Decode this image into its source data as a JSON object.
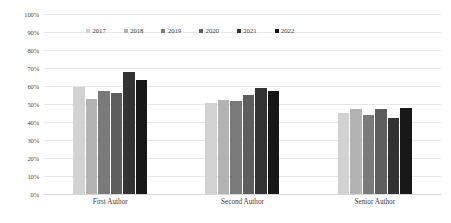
{
  "chart_data": {
    "type": "bar",
    "title": "",
    "subtitle": "",
    "xlabel": "",
    "ylabel": "",
    "categories": [
      "First Author",
      "Second Author",
      "Senior Author"
    ],
    "series": [
      {
        "name": "2017",
        "color": "#d2d2d2",
        "values": [
          59.5,
          50.5,
          45.0
        ]
      },
      {
        "name": "2018",
        "color": "#b3b3b3",
        "values": [
          53.0,
          52.0,
          47.5
        ]
      },
      {
        "name": "2019",
        "color": "#7a7a7a",
        "values": [
          57.5,
          51.5,
          44.0
        ]
      },
      {
        "name": "2020",
        "color": "#5e5e5e",
        "values": [
          56.0,
          55.0,
          47.5
        ]
      },
      {
        "name": "2021",
        "color": "#333333",
        "values": [
          68.0,
          59.0,
          42.5
        ]
      },
      {
        "name": "2022",
        "color": "#171717",
        "values": [
          63.5,
          57.5,
          48.0
        ]
      }
    ],
    "ylim": [
      0,
      100
    ],
    "ytick_labels": [
      "100%",
      "90%",
      "80%",
      "70%",
      "60%",
      "50%",
      "40%",
      "30%",
      "20%",
      "10%",
      "0%"
    ],
    "ytick_values": [
      100,
      90,
      80,
      70,
      60,
      50,
      40,
      30,
      20,
      10,
      0
    ],
    "grid": true,
    "legend_position": "top-center",
    "value_suffix": "%"
  }
}
